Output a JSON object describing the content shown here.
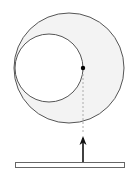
{
  "diagram": {
    "width": 136,
    "height": 186,
    "colors": {
      "background": "#ffffff",
      "stroke": "#555555",
      "crescent_fill": "#f3f3f3",
      "dashed_line": "#999999",
      "point": "#000000",
      "arrow": "#111111",
      "bar_stroke": "#666666",
      "bar_fill": "#ffffff"
    },
    "outer_circle": {
      "cx": 69,
      "cy": 68,
      "r": 55
    },
    "inner_circle": {
      "cx": 49,
      "cy": 68,
      "r": 34
    },
    "point": {
      "cx": 83,
      "cy": 68,
      "r": 2.2
    },
    "dashed_line": {
      "x": 83,
      "y1": 70,
      "y2": 134
    },
    "arrow": {
      "x": 83,
      "y_tail": 162,
      "y_tip": 136
    },
    "bar": {
      "x": 15,
      "y": 162,
      "width": 109,
      "height": 5
    }
  }
}
